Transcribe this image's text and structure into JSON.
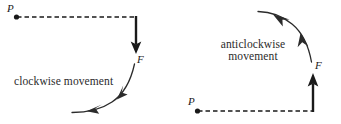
{
  "figure": {
    "background_color": "#ffffff",
    "stroke_color": "#1a1a1a",
    "text_color": "#2b2b2b",
    "width": 341,
    "height": 124
  },
  "left_diagram": {
    "point_label": "P",
    "force_label": "F",
    "caption": "clockwise movement",
    "dashed_line": {
      "from": [
        16,
        17
      ],
      "to": [
        136,
        17
      ],
      "style": "dashed"
    },
    "force_arrow": {
      "from": [
        136,
        17
      ],
      "to": [
        136,
        54
      ],
      "direction": "down"
    },
    "motion_arc": {
      "direction": "clockwise",
      "arrowheads": 2
    }
  },
  "right_diagram": {
    "point_label": "P",
    "force_label": "F",
    "caption_line1": "anticlockwise",
    "caption_line2": "movement",
    "dashed_line": {
      "from": [
        197,
        111
      ],
      "to": [
        313,
        111
      ],
      "style": "dashed"
    },
    "force_arrow": {
      "from": [
        313,
        111
      ],
      "to": [
        313,
        73
      ],
      "direction": "up"
    },
    "motion_arc": {
      "direction": "anticlockwise",
      "arrowheads": 2
    }
  }
}
